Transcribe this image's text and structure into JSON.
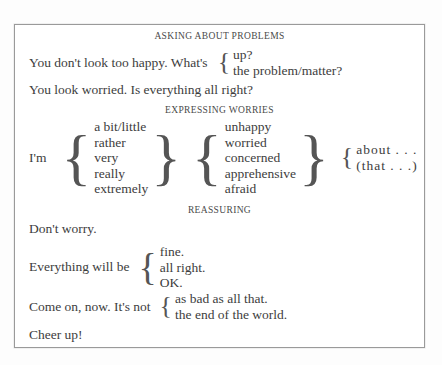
{
  "page": {
    "background": "#fdfdfd",
    "frame_border_color": "#9a9a9a",
    "text_color": "#3d3d3d"
  },
  "sections": [
    {
      "id": "asking-about-problems",
      "heading": "ASKING ABOUT PROBLEMS",
      "lines": [
        {
          "type": "group",
          "lead": "You don't look too happy. What's",
          "options": [
            "up?",
            "the problem/matter?"
          ]
        },
        {
          "type": "plain",
          "text": "You look worried. Is everything all right?"
        }
      ]
    },
    {
      "id": "expressing-worries",
      "heading": "EXPRESSING WORRIES",
      "lines": [
        {
          "type": "multi-group",
          "lead": "I'm",
          "columns": [
            {
              "closing_brace": true,
              "options": [
                "a bit/little",
                "rather",
                "very",
                "really",
                "extremely"
              ]
            },
            {
              "closing_brace": true,
              "options": [
                "unhappy",
                "worried",
                "concerned",
                "apprehensive",
                "afraid"
              ]
            },
            {
              "closing_brace": false,
              "options": [
                "about . . .",
                "(that . . .)"
              ]
            }
          ]
        }
      ]
    },
    {
      "id": "reassuring",
      "heading": "REASSURING",
      "lines": [
        {
          "type": "plain",
          "text": "Don't worry."
        },
        {
          "type": "group",
          "lead": "Everything will be",
          "options": [
            "fine.",
            "all right.",
            "OK."
          ]
        },
        {
          "type": "group",
          "lead": "Come on, now. It's not",
          "options": [
            "as bad as all that.",
            "the end of the world."
          ]
        },
        {
          "type": "plain",
          "text": "Cheer up!"
        }
      ]
    }
  ],
  "braces": {
    "left": "{",
    "right": "}"
  }
}
